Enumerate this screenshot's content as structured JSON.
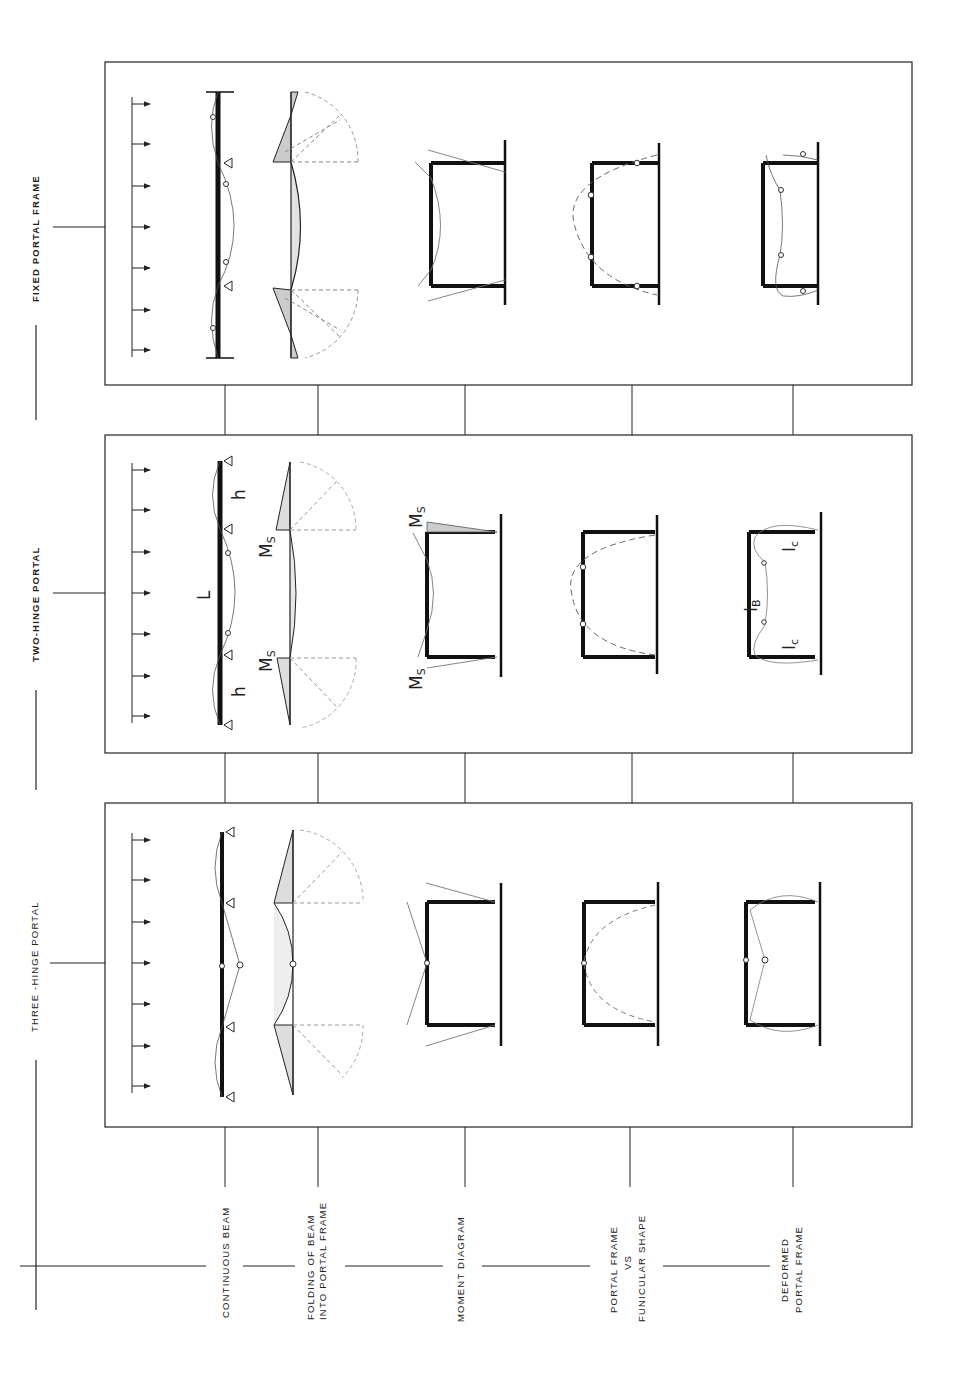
{
  "figure": {
    "columns": [
      {
        "id": "fixed",
        "label": "FIXED PORTAL FRAME"
      },
      {
        "id": "two_hinge",
        "label": "TWO-HINGE PORTAL"
      },
      {
        "id": "three_hinge",
        "label": "THREE -HINGE PORTAL"
      }
    ],
    "rows": [
      {
        "id": "continuous_beam",
        "lines": [
          "CONTINUOUS  BEAM"
        ]
      },
      {
        "id": "folding",
        "lines": [
          "FOLDING  OF  BEAM",
          "INTO PORTAL FRAME"
        ]
      },
      {
        "id": "moment",
        "lines": [
          "MOMENT  DIAGRAM"
        ]
      },
      {
        "id": "funicular",
        "lines": [
          "PORTAL FRAME",
          "VS",
          "FUNICULAR  SHAPE"
        ]
      },
      {
        "id": "deformed",
        "lines": [
          "DEFORMED",
          "PORTAL  FRAME"
        ]
      }
    ],
    "annotations": {
      "span": "L",
      "height_top": "h",
      "height_bottom": "h",
      "support_moment": "M",
      "support_moment_sub": "S",
      "beam_inertia": "I",
      "beam_inertia_sub": "B",
      "column_inertia": "I",
      "column_inertia_sub": "c"
    }
  }
}
